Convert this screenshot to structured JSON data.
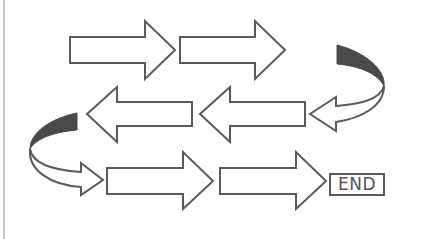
{
  "diagram": {
    "type": "snake-flow",
    "rows": [
      {
        "direction": "right",
        "arrows": 2
      },
      {
        "direction": "left",
        "arrows": 2,
        "entry": "curved-arrow-right-side"
      },
      {
        "direction": "right",
        "arrows": 2,
        "entry": "curved-arrow-left-side"
      }
    ],
    "end_label": "END",
    "colors": {
      "stroke": "#5a5a5a",
      "fill": "#ffffff",
      "curve_shade": "#4a4a4a",
      "frame_line": "#c8c8c8"
    }
  }
}
